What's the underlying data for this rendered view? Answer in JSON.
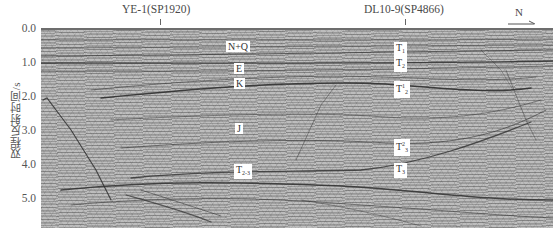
{
  "figure": {
    "type": "seismic-section",
    "wells": [
      {
        "label": "YE-1(SP1920)",
        "x": 160
      },
      {
        "label": "DL10-9(SP4866)",
        "x": 405
      }
    ],
    "orientation": {
      "label": "N",
      "arrow": "right"
    },
    "y_axis": {
      "label": "双程反射时间/s",
      "ticks": [
        "0.0",
        "1.0",
        "2.0",
        "3.0",
        "4.0",
        "5.0"
      ]
    },
    "formation_labels": [
      {
        "text": "N+Q",
        "x": 226,
        "y": 41
      },
      {
        "text": "E",
        "x": 234,
        "y": 63
      },
      {
        "text": "K",
        "x": 234,
        "y": 78
      },
      {
        "text": "J",
        "x": 235,
        "y": 123
      },
      {
        "text": "T",
        "sub": "2-3",
        "x": 234,
        "y": 164
      }
    ],
    "horizon_labels": [
      {
        "text": "T",
        "sub": "1",
        "x": 394,
        "y": 42
      },
      {
        "text": "T",
        "sub": "2",
        "x": 394,
        "y": 57
      },
      {
        "text": "T",
        "sub": "2",
        "sup": "1",
        "x": 394,
        "y": 81
      },
      {
        "text": "T",
        "sub": "3",
        "sup": "2",
        "x": 394,
        "y": 139
      },
      {
        "text": "T",
        "sub": "3",
        "x": 394,
        "y": 163
      }
    ],
    "colors": {
      "background": "#ffffff",
      "seismic_base": "#bdbdbd",
      "reflector": "#2f2f2f",
      "label_bg": "#ffffff",
      "axis_text": "#555555"
    }
  }
}
